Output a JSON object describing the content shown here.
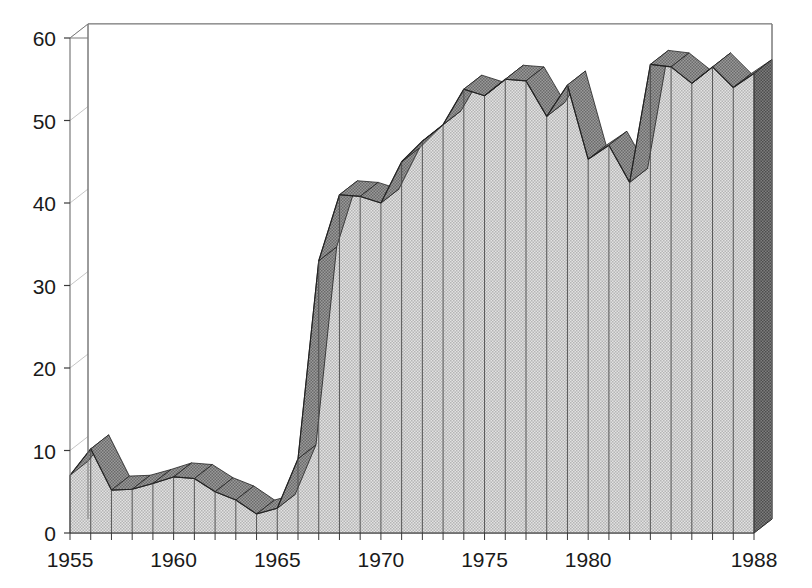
{
  "chart_data": {
    "type": "area",
    "title": "",
    "subtitle": "",
    "xlabel": "",
    "ylabel": "",
    "x": [
      1955,
      1956,
      1957,
      1958,
      1959,
      1960,
      1961,
      1962,
      1963,
      1964,
      1965,
      1966,
      1967,
      1968,
      1969,
      1970,
      1971,
      1972,
      1973,
      1974,
      1975,
      1976,
      1977,
      1978,
      1979,
      1980,
      1981,
      1982,
      1983,
      1984,
      1985,
      1986,
      1987,
      1988
    ],
    "values": [
      7.0,
      10.2,
      5.2,
      5.3,
      6.0,
      6.8,
      6.6,
      5.0,
      4.0,
      2.3,
      3.0,
      9.0,
      33.0,
      41.0,
      40.8,
      40.0,
      45.0,
      47.5,
      49.5,
      53.8,
      53.0,
      55.0,
      54.8,
      50.5,
      54.3,
      45.3,
      47.0,
      42.5,
      56.8,
      56.5,
      54.5,
      56.5,
      54.0,
      55.7
    ],
    "categories": [
      "1955",
      "1956",
      "1957",
      "1958",
      "1959",
      "1960",
      "1961",
      "1962",
      "1963",
      "1964",
      "1965",
      "1966",
      "1967",
      "1968",
      "1969",
      "1970",
      "1971",
      "1972",
      "1973",
      "1974",
      "1975",
      "1976",
      "1977",
      "1978",
      "1979",
      "1980",
      "1981",
      "1982",
      "1983",
      "1984",
      "1985",
      "1986",
      "1987",
      "1988"
    ],
    "series": [
      {
        "name": "series-1",
        "values": [
          7.0,
          10.2,
          5.2,
          5.3,
          6.0,
          6.8,
          6.6,
          5.0,
          4.0,
          2.3,
          3.0,
          9.0,
          33.0,
          41.0,
          40.8,
          40.0,
          45.0,
          47.5,
          49.5,
          53.8,
          53.0,
          55.0,
          54.8,
          50.5,
          54.3,
          45.3,
          47.0,
          42.5,
          56.8,
          56.5,
          54.5,
          56.5,
          54.0,
          55.7
        ]
      }
    ],
    "ylim": [
      0,
      60
    ],
    "xlim": [
      1955,
      1988
    ],
    "y_ticks": [
      0,
      10,
      20,
      30,
      40,
      50,
      60
    ],
    "y_tick_labels": [
      "0",
      "10",
      "20",
      "30",
      "40",
      "50",
      "60"
    ],
    "x_ticks": [
      1955,
      1960,
      1965,
      1970,
      1975,
      1980,
      1988
    ],
    "x_tick_labels": [
      "1955",
      "1960",
      "1965",
      "1970",
      "1975",
      "1980",
      "1988"
    ],
    "x_minor_ticks": [
      1956,
      1957,
      1958,
      1959,
      1961,
      1962,
      1963,
      1964,
      1966,
      1967,
      1968,
      1969,
      1971,
      1972,
      1973,
      1974,
      1976,
      1977,
      1978,
      1979,
      1981,
      1982,
      1983,
      1984,
      1985,
      1986,
      1987
    ],
    "grid": true,
    "legend": "none",
    "legend_position": "none",
    "style": "3d-area",
    "colors": {
      "area_fill": "#c9c9c9",
      "ribbon_top": "#8a8a8a",
      "side_wall": "#6e6e6e",
      "outline": "#222222",
      "grid": "#c6c6c6",
      "frame": "#7a7a7a",
      "text": "#1a1a1a",
      "background": "#ffffff"
    }
  }
}
